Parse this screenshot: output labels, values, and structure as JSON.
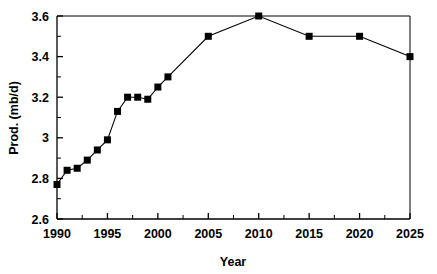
{
  "chart_data": {
    "type": "line",
    "title": "",
    "xlabel": "Year",
    "ylabel": "Prod. (mb/d)",
    "xlim": [
      1990,
      2025
    ],
    "ylim": [
      2.6,
      3.6
    ],
    "grid": false,
    "legend": null,
    "marker": "filled-square",
    "line_color": "#000000",
    "marker_color": "#000000",
    "x_ticks": [
      1990,
      1995,
      2000,
      2005,
      2010,
      2015,
      2020,
      2025
    ],
    "x_tick_labels": [
      "1990",
      "1995",
      "2000",
      "2005",
      "2010",
      "2015",
      "2020",
      "2025"
    ],
    "x_minor_ticks": [
      1992.5,
      1997.5,
      2002.5,
      2007.5,
      2012.5,
      2017.5,
      2022.5
    ],
    "y_ticks": [
      2.6,
      2.8,
      3.0,
      3.2,
      3.4,
      3.6
    ],
    "y_tick_labels": [
      "2.6",
      "2.8",
      "3",
      "3.2",
      "3.4",
      "3.6"
    ],
    "y_minor_ticks": [
      2.7,
      2.9,
      3.1,
      3.3,
      3.5
    ],
    "x": [
      1990,
      1991,
      1992,
      1993,
      1994,
      1995,
      1996,
      1997,
      1998,
      1999,
      2000,
      2001,
      2005,
      2010,
      2015,
      2020,
      2025
    ],
    "values": [
      2.77,
      2.84,
      2.85,
      2.89,
      2.94,
      2.99,
      3.13,
      3.2,
      3.2,
      3.19,
      3.25,
      3.3,
      3.5,
      3.6,
      3.5,
      3.5,
      3.4
    ],
    "series": [
      {
        "name": "Prod.",
        "points": [
          {
            "x": 1990,
            "y": 2.77
          },
          {
            "x": 1991,
            "y": 2.84
          },
          {
            "x": 1992,
            "y": 2.85
          },
          {
            "x": 1993,
            "y": 2.89
          },
          {
            "x": 1994,
            "y": 2.94
          },
          {
            "x": 1995,
            "y": 2.99
          },
          {
            "x": 1996,
            "y": 3.13
          },
          {
            "x": 1997,
            "y": 3.2
          },
          {
            "x": 1998,
            "y": 3.2
          },
          {
            "x": 1999,
            "y": 3.19
          },
          {
            "x": 2000,
            "y": 3.25
          },
          {
            "x": 2001,
            "y": 3.3
          },
          {
            "x": 2005,
            "y": 3.5
          },
          {
            "x": 2010,
            "y": 3.6
          },
          {
            "x": 2015,
            "y": 3.5
          },
          {
            "x": 2020,
            "y": 3.5
          },
          {
            "x": 2025,
            "y": 3.4
          }
        ]
      }
    ]
  },
  "plot": {
    "left": 57,
    "right": 410,
    "top": 16,
    "bottom": 219
  }
}
